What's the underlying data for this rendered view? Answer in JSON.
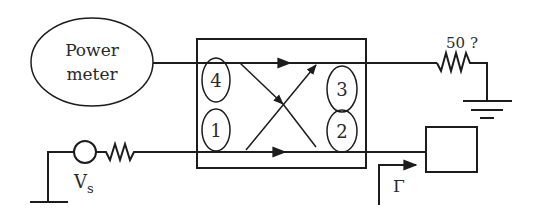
{
  "diagram": {
    "type": "circuit-schematic",
    "colors": {
      "stroke": "#1c1c1c",
      "text": "#2a2a2a",
      "background": "#ffffff"
    },
    "power_meter": {
      "line1": "Power",
      "line2": "meter"
    },
    "coupler": {
      "ports": [
        {
          "id": "port-4",
          "label": "4"
        },
        {
          "id": "port-3",
          "label": "3"
        },
        {
          "id": "port-1",
          "label": "1"
        },
        {
          "id": "port-2",
          "label": "2"
        }
      ]
    },
    "termination": {
      "label": "50 ?"
    },
    "source": {
      "label_main": "V",
      "label_sub": "s"
    },
    "reflection": {
      "label": "Γ"
    }
  }
}
